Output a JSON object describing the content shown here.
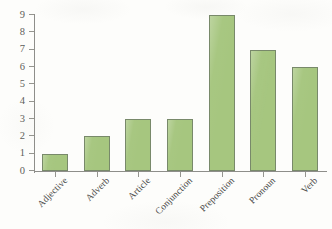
{
  "chart_data": {
    "type": "bar",
    "title": "",
    "subtitle": "",
    "xlabel": "",
    "ylabel": "",
    "categories": [
      "Adjective",
      "Adverb",
      "Article",
      "Conjunction",
      "Preposition",
      "Pronoun",
      "Verb"
    ],
    "values": [
      1,
      2,
      3,
      3,
      9,
      7,
      6
    ],
    "ylim": [
      0,
      9
    ],
    "ytick_labels": [
      "0",
      "1",
      "2",
      "3",
      "4",
      "5",
      "6",
      "7",
      "8",
      "9"
    ],
    "ytick_values": [
      0,
      1,
      2,
      3,
      4,
      5,
      6,
      7,
      8,
      9
    ],
    "grid": false,
    "legend": false,
    "legend_position": "none",
    "xtick_label_rotation": -45,
    "bar_fill_color": "#a6c67f",
    "bar_border_color": "#78896a",
    "axis_color": "#8e8e8a",
    "tick_label_color": "#5d5d5a",
    "category_label_color": "#4a4a48",
    "background_color": "#fdfdfb"
  }
}
